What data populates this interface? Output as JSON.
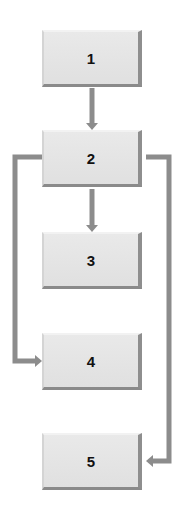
{
  "diagram": {
    "type": "flowchart",
    "nodes": [
      {
        "id": "n1",
        "label": "1"
      },
      {
        "id": "n2",
        "label": "2"
      },
      {
        "id": "n3",
        "label": "3"
      },
      {
        "id": "n4",
        "label": "4"
      },
      {
        "id": "n5",
        "label": "5"
      }
    ],
    "edges": [
      {
        "from": "1",
        "to": "2",
        "route": "straight-down"
      },
      {
        "from": "2",
        "to": "3",
        "route": "straight-down"
      },
      {
        "from": "2",
        "to": "4",
        "route": "left-side"
      },
      {
        "from": "2",
        "to": "5",
        "route": "right-side"
      }
    ],
    "colors": {
      "node_fill": "#e2e2e2",
      "node_shadow": "#8a8a8a",
      "connector": "#8c8c8c",
      "label": "#111111"
    }
  }
}
